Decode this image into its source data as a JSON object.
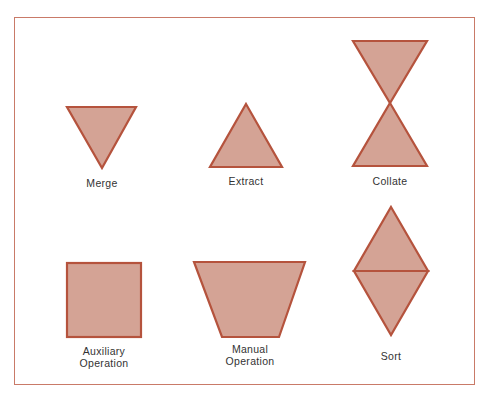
{
  "colors": {
    "fill": "#d4a395",
    "stroke": "#b5533d",
    "frame": "#c97a68"
  },
  "symbols": [
    {
      "id": "merge",
      "label": "Merge",
      "shape": "inverted-triangle"
    },
    {
      "id": "extract",
      "label": "Extract",
      "shape": "triangle"
    },
    {
      "id": "collate",
      "label": "Collate",
      "shape": "hourglass"
    },
    {
      "id": "auxiliary-operation",
      "label": "Auxiliary Operation",
      "label_lines": [
        "Auxiliary",
        "Operation"
      ],
      "shape": "square"
    },
    {
      "id": "manual-operation",
      "label": "Manual Operation",
      "label_lines": [
        "Manual",
        "Operation"
      ],
      "shape": "trapezoid"
    },
    {
      "id": "sort",
      "label": "Sort",
      "shape": "diamond-split"
    }
  ]
}
